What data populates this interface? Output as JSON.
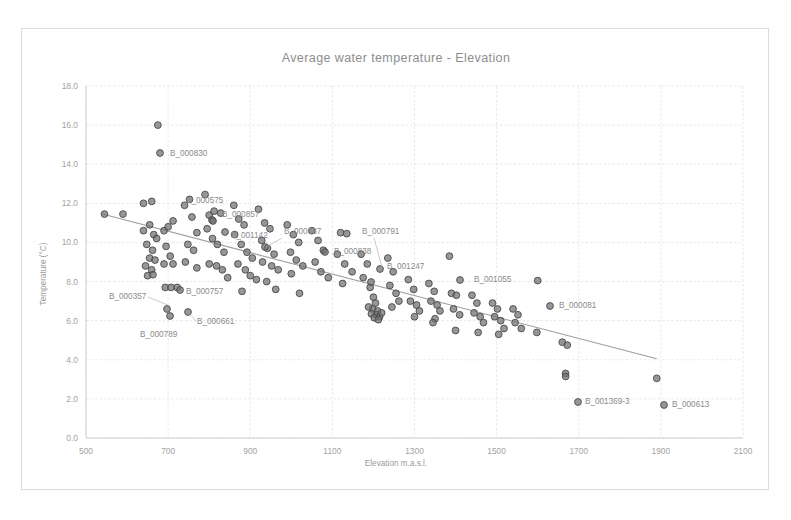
{
  "chart_data": {
    "type": "scatter",
    "title": "Average water temperature - Elevation",
    "xlabel": "Elevation m.a.s.l.",
    "ylabel": "Temperature (°C)",
    "xlim": [
      500,
      2100
    ],
    "ylim": [
      0.0,
      18.0
    ],
    "xticks": [
      "500",
      "700",
      "900",
      "1100",
      "1300",
      "1500",
      "1700",
      "1900",
      "2100"
    ],
    "yticks": [
      "0.0",
      "2.0",
      "4.0",
      "6.0",
      "8.0",
      "10.0",
      "12.0",
      "14.0",
      "16.0",
      "18.0"
    ],
    "grid": true,
    "legend": "none",
    "marker_color": "#6f6f6f",
    "trendline_color": "#9e9e9e",
    "trendline": {
      "x": [
        540,
        1890
      ],
      "y": [
        11.45,
        4.05
      ]
    },
    "points": [
      [
        545,
        11.45
      ],
      [
        590,
        11.45
      ],
      [
        640,
        12.0
      ],
      [
        660,
        12.1
      ],
      [
        640,
        10.6
      ],
      [
        655,
        10.9
      ],
      [
        665,
        10.4
      ],
      [
        672,
        10.2
      ],
      [
        648,
        9.9
      ],
      [
        662,
        9.6
      ],
      [
        655,
        9.2
      ],
      [
        668,
        9.1
      ],
      [
        645,
        8.8
      ],
      [
        660,
        8.6
      ],
      [
        650,
        8.3
      ],
      [
        663,
        8.35
      ],
      [
        675,
        16.0
      ],
      [
        690,
        10.6
      ],
      [
        700,
        10.8
      ],
      [
        712,
        11.1
      ],
      [
        695,
        9.8
      ],
      [
        705,
        9.3
      ],
      [
        690,
        8.9
      ],
      [
        712,
        8.9
      ],
      [
        693,
        7.7
      ],
      [
        707,
        7.7
      ],
      [
        722,
        7.7
      ],
      [
        740,
        11.9
      ],
      [
        752,
        12.2
      ],
      [
        758,
        11.3
      ],
      [
        770,
        10.5
      ],
      [
        748,
        9.9
      ],
      [
        762,
        9.6
      ],
      [
        742,
        9.0
      ],
      [
        770,
        8.7
      ],
      [
        790,
        12.45
      ],
      [
        800,
        11.4
      ],
      [
        812,
        11.6
      ],
      [
        828,
        11.5
      ],
      [
        795,
        10.7
      ],
      [
        808,
        10.2
      ],
      [
        820,
        9.9
      ],
      [
        836,
        9.5
      ],
      [
        800,
        8.9
      ],
      [
        818,
        8.8
      ],
      [
        832,
        8.6
      ],
      [
        845,
        8.2
      ],
      [
        860,
        11.9
      ],
      [
        872,
        11.2
      ],
      [
        885,
        10.9
      ],
      [
        862,
        10.4
      ],
      [
        878,
        9.9
      ],
      [
        892,
        9.5
      ],
      [
        905,
        9.2
      ],
      [
        870,
        8.9
      ],
      [
        888,
        8.6
      ],
      [
        900,
        8.3
      ],
      [
        915,
        8.1
      ],
      [
        880,
        7.5
      ],
      [
        920,
        11.7
      ],
      [
        935,
        11.0
      ],
      [
        948,
        10.7
      ],
      [
        928,
        10.1
      ],
      [
        942,
        9.7
      ],
      [
        958,
        9.4
      ],
      [
        930,
        9.0
      ],
      [
        952,
        8.8
      ],
      [
        968,
        8.6
      ],
      [
        940,
        8.0
      ],
      [
        962,
        7.6
      ],
      [
        990,
        10.9
      ],
      [
        1005,
        10.4
      ],
      [
        1018,
        10.0
      ],
      [
        998,
        9.5
      ],
      [
        1012,
        9.1
      ],
      [
        1028,
        8.8
      ],
      [
        1000,
        8.4
      ],
      [
        1020,
        7.4
      ],
      [
        1050,
        10.6
      ],
      [
        1065,
        10.1
      ],
      [
        1078,
        9.6
      ],
      [
        1058,
        9.0
      ],
      [
        1072,
        8.5
      ],
      [
        1090,
        8.2
      ],
      [
        1120,
        10.5
      ],
      [
        1135,
        10.45
      ],
      [
        1112,
        9.4
      ],
      [
        1130,
        8.9
      ],
      [
        1148,
        8.5
      ],
      [
        1125,
        7.9
      ],
      [
        1170,
        9.4
      ],
      [
        1185,
        8.9
      ],
      [
        1175,
        8.2
      ],
      [
        1192,
        7.7
      ],
      [
        1200,
        7.2
      ],
      [
        1205,
        6.9
      ],
      [
        1198,
        6.6
      ],
      [
        1210,
        6.5
      ],
      [
        1195,
        6.35
      ],
      [
        1208,
        6.3
      ],
      [
        1215,
        6.2
      ],
      [
        1202,
        6.15
      ],
      [
        1212,
        6.05
      ],
      [
        1220,
        6.4
      ],
      [
        1188,
        6.7
      ],
      [
        1235,
        9.2
      ],
      [
        1248,
        8.5
      ],
      [
        1240,
        7.8
      ],
      [
        1255,
        7.4
      ],
      [
        1262,
        7.0
      ],
      [
        1245,
        6.7
      ],
      [
        1285,
        8.1
      ],
      [
        1298,
        7.6
      ],
      [
        1290,
        7.0
      ],
      [
        1305,
        6.8
      ],
      [
        1312,
        6.5
      ],
      [
        1300,
        6.2
      ],
      [
        1335,
        7.9
      ],
      [
        1348,
        7.5
      ],
      [
        1340,
        7.0
      ],
      [
        1355,
        6.8
      ],
      [
        1362,
        6.5
      ],
      [
        1350,
        6.1
      ],
      [
        1345,
        5.9
      ],
      [
        1385,
        9.3
      ],
      [
        1390,
        7.4
      ],
      [
        1402,
        7.3
      ],
      [
        1395,
        6.6
      ],
      [
        1410,
        6.3
      ],
      [
        1400,
        5.5
      ],
      [
        1440,
        7.3
      ],
      [
        1452,
        6.9
      ],
      [
        1445,
        6.4
      ],
      [
        1460,
        6.2
      ],
      [
        1468,
        5.9
      ],
      [
        1455,
        5.4
      ],
      [
        1490,
        6.9
      ],
      [
        1502,
        6.6
      ],
      [
        1495,
        6.2
      ],
      [
        1510,
        6.0
      ],
      [
        1518,
        5.6
      ],
      [
        1505,
        5.3
      ],
      [
        1540,
        6.6
      ],
      [
        1552,
        6.3
      ],
      [
        1545,
        5.9
      ],
      [
        1560,
        5.6
      ],
      [
        1600,
        8.05
      ],
      [
        1598,
        5.4
      ],
      [
        1660,
        4.9
      ],
      [
        1672,
        4.75
      ],
      [
        1668,
        3.3
      ],
      [
        1668,
        3.15
      ],
      [
        1890,
        3.05
      ]
    ],
    "annotations": [
      {
        "id": "B_000830",
        "label_x": 148,
        "label_y": 127,
        "dot_x": 138,
        "dot_y": 124,
        "leader": null
      },
      {
        "id": "B_000575",
        "label_x": 164,
        "label_y": 174,
        "dot_x": 190,
        "dot_y": 191,
        "leader": null
      },
      {
        "id": "B_000857",
        "label_x": 200,
        "label_y": 188,
        "dot_x": 191,
        "dot_y": 192,
        "leader": null
      },
      {
        "id": "B_001142",
        "label_x": 209,
        "label_y": 209,
        "dot_x": 203,
        "dot_y": 203,
        "leader": null
      },
      {
        "id": "B_000887",
        "label_x": 262,
        "label_y": 205,
        "dot_x": 243,
        "dot_y": 218,
        "leader": [
          260,
          209,
          244,
          218
        ]
      },
      {
        "id": "B_000791",
        "label_x": 340,
        "label_y": 205,
        "dot_x": 358,
        "dot_y": 240,
        "leader": [
          352,
          209,
          360,
          238
        ]
      },
      {
        "id": "B_000838",
        "label_x": 312,
        "label_y": 225,
        "dot_x": 303,
        "dot_y": 223,
        "leader": null
      },
      {
        "id": "B_001247",
        "label_x": 365,
        "label_y": 240,
        "dot_x": 349,
        "dot_y": 253,
        "leader": null
      },
      {
        "id": "B_001055",
        "label_x": 452,
        "label_y": 253,
        "dot_x": 438,
        "dot_y": 251,
        "leader": null
      },
      {
        "id": "B_000081",
        "label_x": 537,
        "label_y": 279,
        "dot_x": 528,
        "dot_y": 277,
        "leader": null
      },
      {
        "id": "B_000357",
        "label_x": 87,
        "label_y": 270,
        "dot_x": 145,
        "dot_y": 280,
        "leader": [
          126,
          268,
          148,
          277
        ]
      },
      {
        "id": "B_000757",
        "label_x": 164,
        "label_y": 265,
        "dot_x": 158,
        "dot_y": 261,
        "leader": null
      },
      {
        "id": "B_000661",
        "label_x": 175,
        "label_y": 295,
        "dot_x": 166,
        "dot_y": 283,
        "leader": [
          174,
          292,
          168,
          285
        ]
      },
      {
        "id": "B_000789",
        "label_x": 118,
        "label_y": 308,
        "dot_x": 148,
        "dot_y": 287,
        "leader": null
      },
      {
        "id": "B_001369-3",
        "label_x": 563,
        "label_y": 375,
        "dot_x": 556,
        "dot_y": 373,
        "leader": null
      },
      {
        "id": "B_000613",
        "label_x": 650,
        "label_y": 378,
        "dot_x": 642,
        "dot_y": 376,
        "leader": null
      }
    ]
  }
}
